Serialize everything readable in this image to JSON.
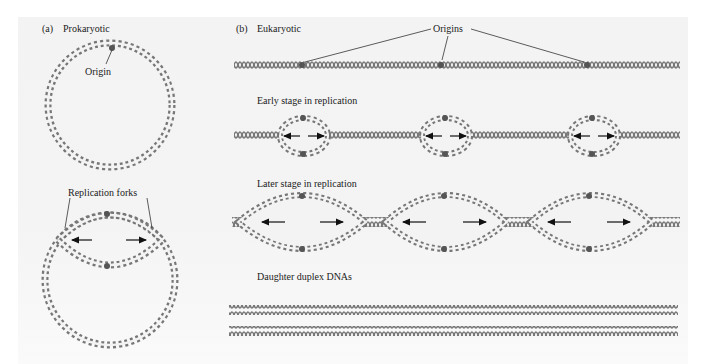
{
  "panel_a": {
    "label": "(a)",
    "title": "Prokaryotic",
    "origin_label": "Origin",
    "forks_label": "Replication forks"
  },
  "panel_b": {
    "label": "(b)",
    "title": "Eukaryotic",
    "origins_label": "Origins",
    "stages": [
      {
        "label": "Early stage in replication"
      },
      {
        "label": "Later stage in replication"
      },
      {
        "label": "Daughter duplex DNAs"
      }
    ]
  },
  "colors": {
    "helix": "#7a7a7a",
    "helix_fill": "#ffffff",
    "origin_marker": "#555555",
    "arrow": "#111111",
    "text": "#222222",
    "panel_bg": "#f3f3f3"
  }
}
